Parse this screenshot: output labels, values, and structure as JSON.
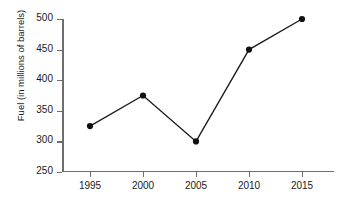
{
  "chart_data": {
    "type": "line",
    "title": "",
    "xlabel": "",
    "ylabel": "Fuel (in millions of barrels)",
    "categories": [
      "1995",
      "2000",
      "2005",
      "2010",
      "2015"
    ],
    "x": [
      1995,
      2000,
      2005,
      2010,
      2015
    ],
    "values": [
      325,
      375,
      300,
      450,
      500
    ],
    "series": [
      {
        "name": "Fuel consumed",
        "values": [
          325,
          375,
          300,
          450,
          500
        ]
      }
    ],
    "ylim": [
      250,
      500
    ],
    "yticks": [
      250,
      300,
      350,
      400,
      450,
      500
    ],
    "xticks": [
      "1995",
      "2000",
      "2005",
      "2010",
      "2015"
    ],
    "grid": false,
    "legend": false,
    "marker": "filled-circle",
    "line_color": "#1a1a1a",
    "marker_color": "#111111",
    "axis_color": "#6e6e6e",
    "background_color": "#ffffff"
  }
}
